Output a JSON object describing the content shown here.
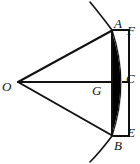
{
  "figure": {
    "type": "geometry-diagram",
    "canvas": {
      "width": 140,
      "height": 164,
      "background": "#ffffff"
    },
    "stroke_color": "#111111",
    "fill_color": "#000000",
    "points": [
      {
        "id": "O",
        "label": "O",
        "x": 18,
        "y": 82,
        "label_x": 2,
        "label_y": 80
      },
      {
        "id": "A",
        "label": "A",
        "x": 112,
        "y": 30,
        "label_x": 114,
        "label_y": 17
      },
      {
        "id": "F",
        "label": "F",
        "x": 129,
        "y": 30,
        "label_x": 127,
        "label_y": 24
      },
      {
        "id": "C",
        "label": "C",
        "x": 129,
        "y": 82,
        "label_x": 126,
        "label_y": 72
      },
      {
        "id": "G",
        "label": "G",
        "x": 112,
        "y": 82,
        "label_x": 92,
        "label_y": 84
      },
      {
        "id": "E",
        "label": "E",
        "x": 129,
        "y": 136,
        "label_x": 127,
        "label_y": 126
      },
      {
        "id": "B",
        "label": "B",
        "x": 112,
        "y": 136,
        "label_x": 114,
        "label_y": 139
      }
    ],
    "segments": [
      {
        "name": "O-to-A",
        "from": "O",
        "to": "A"
      },
      {
        "name": "O-to-C",
        "from": "O",
        "to": "C"
      },
      {
        "name": "O-to-B",
        "from": "O",
        "to": "B"
      }
    ],
    "rectangle": {
      "name": "A-F-E-B",
      "left": 112,
      "top": 30,
      "right": 129,
      "bottom": 136
    },
    "shaded_region": {
      "name": "circular-segment-A-C-B",
      "description": "Black filled lens between chord AB and arc ACB",
      "chord": [
        "A",
        "B"
      ],
      "apex": "C"
    },
    "arc": {
      "name": "circle-arc-through-A-C-B",
      "through": [
        "A",
        "C",
        "B"
      ],
      "extends_beyond": true
    }
  }
}
